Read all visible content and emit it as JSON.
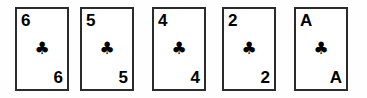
{
  "scene": {
    "title": "Playing card hand",
    "background_color": "#fefefe",
    "card_face_color": "#ffffff",
    "card_border_color": "#2b2b2b",
    "ink_color": "#000000"
  },
  "cards": [
    {
      "rank": "6",
      "suit_symbol": "♣",
      "suit_name": "clubs",
      "icon_name": "club-suit-icon",
      "left": 15
    },
    {
      "rank": "5",
      "suit_symbol": "♣",
      "suit_name": "clubs",
      "icon_name": "club-suit-icon",
      "left": 80
    },
    {
      "rank": "4",
      "suit_symbol": "♣",
      "suit_name": "clubs",
      "icon_name": "club-suit-icon",
      "left": 152
    },
    {
      "rank": "2",
      "suit_symbol": "♣",
      "suit_name": "clubs",
      "icon_name": "club-suit-icon",
      "left": 222
    },
    {
      "rank": "A",
      "suit_symbol": "♣",
      "suit_name": "clubs",
      "icon_name": "club-suit-icon",
      "left": 294
    }
  ]
}
